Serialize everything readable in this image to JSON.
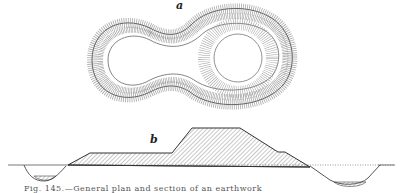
{
  "figure": {
    "plan_label": "a",
    "section_label": "b",
    "caption": "Fig. 145.—General plan and section of an earthwork",
    "colors": {
      "ink": "#333333",
      "hatch": "#888888",
      "paper": "#ffffff"
    }
  }
}
